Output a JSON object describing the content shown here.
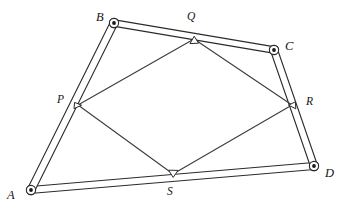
{
  "figure": {
    "background_color": "#ffffff",
    "stroke_color": "#2b2b2b",
    "inner_stroke_color": "#3a3a3a",
    "width": 347,
    "height": 215
  },
  "vertices": [
    {
      "id": "A",
      "label": "A",
      "x": 31,
      "y": 190,
      "label_x": 7,
      "label_y": 189
    },
    {
      "id": "B",
      "label": "B",
      "x": 114,
      "y": 23,
      "label_x": 96,
      "label_y": 11
    },
    {
      "id": "C",
      "label": "C",
      "x": 274,
      "y": 50,
      "label_x": 285,
      "label_y": 40
    },
    {
      "id": "D",
      "label": "D",
      "x": 314,
      "y": 166,
      "label_x": 325,
      "label_y": 167
    }
  ],
  "points": [
    {
      "id": "P",
      "label": "P",
      "x": 78,
      "y": 105,
      "on_bar": "A-B",
      "label_x": 57,
      "label_y": 94
    },
    {
      "id": "Q",
      "label": "Q",
      "x": 194,
      "y": 39,
      "on_bar": "B-C",
      "label_x": 187,
      "label_y": 11
    },
    {
      "id": "R",
      "label": "R",
      "x": 292,
      "y": 105,
      "on_bar": "C-D",
      "label_x": 306,
      "label_y": 96
    },
    {
      "id": "S",
      "label": "S",
      "x": 173,
      "y": 174,
      "on_bar": "D-A",
      "label_x": 167,
      "label_y": 186
    }
  ],
  "outer_bars": [
    {
      "id": "bar-AB",
      "from": "A",
      "to": "B",
      "x1": 31,
      "y1": 190,
      "x2": 114,
      "y2": 23,
      "thickness": 7
    },
    {
      "id": "bar-BC",
      "from": "B",
      "to": "C",
      "x1": 114,
      "y1": 23,
      "x2": 274,
      "y2": 50,
      "thickness": 7
    },
    {
      "id": "bar-CD",
      "from": "C",
      "to": "D",
      "x1": 274,
      "y1": 50,
      "x2": 314,
      "y2": 166,
      "thickness": 7
    },
    {
      "id": "bar-DA",
      "from": "D",
      "to": "A",
      "x1": 314,
      "y1": 166,
      "x2": 31,
      "y2": 190,
      "thickness": 7
    }
  ],
  "inner_edges": [
    {
      "id": "edge-PQ",
      "from": "P",
      "to": "Q",
      "x1": 78,
      "y1": 105,
      "x2": 194,
      "y2": 39
    },
    {
      "id": "edge-QR",
      "from": "Q",
      "to": "R",
      "x1": 194,
      "y1": 39,
      "x2": 292,
      "y2": 105
    },
    {
      "id": "edge-RS",
      "from": "R",
      "to": "S",
      "x1": 292,
      "y1": 105,
      "x2": 173,
      "y2": 174
    },
    {
      "id": "edge-SP",
      "from": "S",
      "to": "P",
      "x1": 173,
      "y1": 174,
      "x2": 78,
      "y2": 105
    }
  ]
}
